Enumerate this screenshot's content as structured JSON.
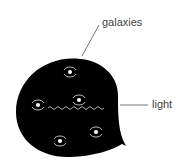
{
  "labels": {
    "galaxies": "galaxies",
    "light": "light"
  },
  "colors": {
    "balloon": "#000000",
    "galaxy": "#cccccc",
    "wave": "#dddddd",
    "leader": "#555555"
  }
}
